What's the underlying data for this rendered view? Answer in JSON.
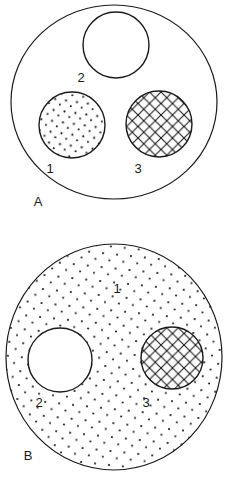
{
  "figure": {
    "title": "",
    "background_color": "#ffffff",
    "stroke_color": "#1a1a1a",
    "fill_color": "#ffffff",
    "width": 228,
    "height": 480,
    "panels": [
      {
        "id": "panel-a",
        "label": "A",
        "label_x": 38,
        "label_y": 206,
        "outer_circle": {
          "name": "outer-circle-a",
          "cx": 114,
          "cy": 102,
          "rx": 103,
          "ry": 97,
          "fill_pattern": "none",
          "fill_label": ""
        },
        "inner_circles": [
          {
            "name": "region-1-dotted",
            "region": "1",
            "cx": 72,
            "cy": 125,
            "r": 33,
            "fill_pattern": "dots",
            "label": "1",
            "label_x": 50,
            "label_y": 173
          },
          {
            "name": "region-2-blank",
            "region": "2",
            "cx": 116,
            "cy": 45,
            "r": 33,
            "fill_pattern": "none",
            "label": "2",
            "label_x": 81,
            "label_y": 82
          },
          {
            "name": "region-3-crosshatch",
            "region": "3",
            "cx": 159,
            "cy": 124,
            "r": 33,
            "fill_pattern": "crosshatch",
            "label": "3",
            "label_x": 138,
            "label_y": 173
          }
        ]
      },
      {
        "id": "panel-b",
        "label": "B",
        "label_x": 28,
        "label_y": 460,
        "outer_circle": {
          "name": "outer-circle-b",
          "cx": 114,
          "cy": 357,
          "rx": 108,
          "ry": 113,
          "fill_pattern": "dots",
          "fill_label": "1"
        },
        "inner_circles": [
          {
            "name": "region-2-blank",
            "region": "2",
            "cx": 60,
            "cy": 360,
            "r": 32,
            "fill_pattern": "none",
            "label": "2",
            "label_x": 39,
            "label_y": 407
          },
          {
            "name": "region-3-crosshatch",
            "region": "3",
            "cx": 172,
            "cy": 358,
            "r": 31,
            "fill_pattern": "crosshatch",
            "label": "3",
            "label_x": 146,
            "label_y": 407
          }
        ],
        "area_label": {
          "name": "region-1-label",
          "text": "1",
          "x": 117,
          "y": 293
        }
      }
    ],
    "legend_keys": [
      {
        "key": "1",
        "pattern": "dots",
        "description": "dotted region"
      },
      {
        "key": "2",
        "pattern": "none",
        "description": "blank region"
      },
      {
        "key": "3",
        "pattern": "crosshatch",
        "description": "cross-hatched region"
      }
    ]
  }
}
